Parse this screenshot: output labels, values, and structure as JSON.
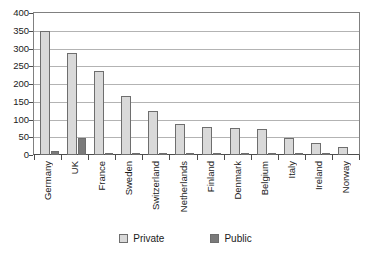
{
  "chart_data": {
    "type": "bar",
    "title": "",
    "xlabel": "",
    "ylabel": "",
    "ylim": [
      0,
      400
    ],
    "ytick_step": 50,
    "yticks": [
      0,
      50,
      100,
      150,
      200,
      250,
      300,
      350,
      400
    ],
    "grid": true,
    "legend_position": "bottom-center",
    "categories": [
      "Germany",
      "UK",
      "France",
      "Sweden",
      "Switzerland",
      "Netherlands",
      "Finland",
      "Denmark",
      "Belgium",
      "Italy",
      "Ireland",
      "Norway"
    ],
    "series": [
      {
        "name": "Private",
        "color": "#d9d9d9",
        "values": [
          348,
          287,
          237,
          165,
          125,
          88,
          78,
          75,
          72,
          48,
          35,
          22
        ]
      },
      {
        "name": "Public",
        "color": "#7a7a7a",
        "values": [
          12,
          48,
          7,
          6,
          5,
          4,
          4,
          7,
          3,
          5,
          4,
          0
        ]
      }
    ]
  },
  "legend": {
    "items": [
      {
        "label": "Private",
        "swatch": "private-swatch"
      },
      {
        "label": "Public",
        "swatch": "public-swatch"
      }
    ]
  }
}
